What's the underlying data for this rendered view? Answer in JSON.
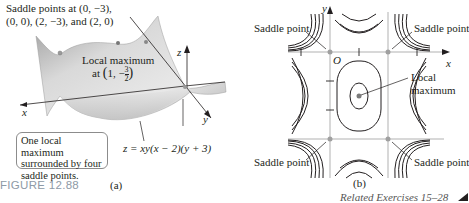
{
  "figure": {
    "label": "FIGURE 12.88",
    "related": "Related Exercises 15–28"
  },
  "panel_a": {
    "caption": "(a)",
    "saddle_note_line1": "Saddle points at (0, −3),",
    "saddle_note_line2": "(0, 0), (2, −3), and (2, 0)",
    "local_max_line1": "Local maximum",
    "local_max_prefix": "at",
    "local_max_x": "1,",
    "local_max_frac_num": "3",
    "local_max_frac_den": "2",
    "callout_line1": "One local maximum",
    "callout_line2": "surrounded by four",
    "callout_line3": "saddle points.",
    "equation": "z = xy(x − 2)(y + 3)",
    "axis_x": "x",
    "axis_y": "y",
    "axis_z": "z"
  },
  "panel_b": {
    "caption": "(b)",
    "saddle_tl": "Saddle point",
    "saddle_tr": "Saddle point",
    "saddle_bl": "Saddle point",
    "saddle_br": "Saddle point",
    "local_max_line1": "Local",
    "local_max_line2": "maximum",
    "origin": "O",
    "axis_x": "x",
    "axis_y": "y"
  },
  "colors": {
    "figure_label": "#8e9aa6",
    "surface": "#c8c8c8",
    "contour": "#231f20",
    "grid": "#a0a0a0",
    "point": "#8c8c8c"
  }
}
